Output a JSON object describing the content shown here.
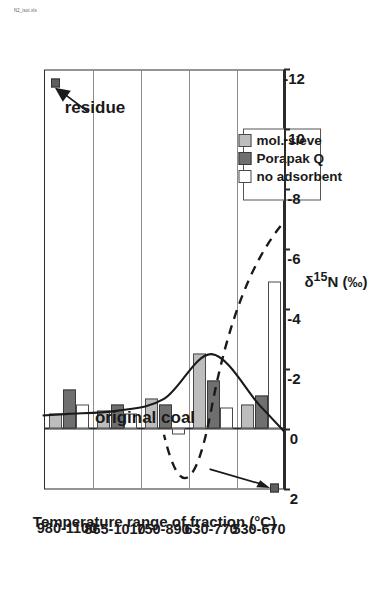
{
  "worksheet_tag": "N2_isot.xls",
  "chart_data": {
    "type": "bar",
    "orientation": "rotated-90",
    "title": "",
    "xlabel": "Temperature range of fraction (°C)",
    "ylabel": "δ 15N (‰)",
    "ylabel_parts": {
      "delta": "δ",
      "sup": "15",
      "element": "N",
      "units": "(‰)"
    },
    "categories": [
      "530-670",
      "630-770",
      "750-890",
      "865-1010",
      "980-1100"
    ],
    "ylim": [
      2,
      -12
    ],
    "yticks": [
      2,
      0,
      -2,
      -4,
      -6,
      -8,
      -10,
      -12
    ],
    "ytick_labels": [
      "2",
      "0",
      "-2",
      "-4",
      "-6",
      "-8",
      "-10",
      "-12"
    ],
    "grid": "category-separators",
    "legend_position": "inside-lower-right",
    "series": [
      {
        "name": "mol. sieve",
        "color": "#bdbdbd",
        "values": [
          -0.8,
          -2.5,
          -1.0,
          -0.6,
          -0.5
        ]
      },
      {
        "name": "Porapak Q",
        "color": "#6f6f6f",
        "values": [
          -1.1,
          -1.6,
          -0.8,
          -0.8,
          -1.3
        ]
      },
      {
        "name": "no adsorbent",
        "color": "#ffffff",
        "values": [
          -4.9,
          -0.7,
          0.2,
          -0.5,
          -0.8
        ]
      }
    ],
    "trend_lines": [
      {
        "name": "mol. sieve trend",
        "style": "solid",
        "color": "#1a1a1a"
      },
      {
        "name": "no adsorbent trend",
        "style": "dashed",
        "color": "#1a1a1a"
      }
    ],
    "annotations": [
      {
        "label": "original coal",
        "value": 2.0,
        "marker": "filled-square"
      },
      {
        "label": "residue",
        "value": -11.5,
        "marker": "filled-square"
      }
    ]
  },
  "legend": {
    "items": [
      {
        "label": "mol. sieve",
        "swatch": "molsieve"
      },
      {
        "label": "Porapak Q",
        "swatch": "porapak"
      },
      {
        "label": "no adsorbent",
        "swatch": "noads"
      }
    ]
  }
}
